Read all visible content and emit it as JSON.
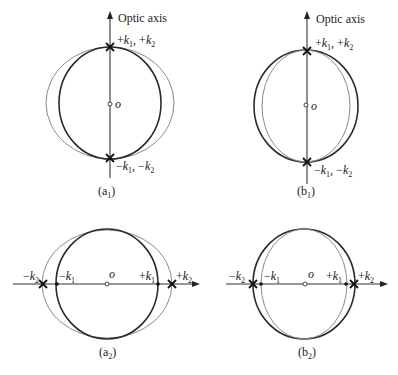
{
  "figure": {
    "panels": [
      {
        "id": "a1",
        "caption": "(a",
        "caption_sub": "1",
        "axis_label": "Optic axis",
        "origin_label": "o",
        "top_label": "+k1, +k2",
        "bottom_label": "−k1, −k2"
      },
      {
        "id": "b1",
        "caption": "(b",
        "caption_sub": "1",
        "axis_label": "Optic axis",
        "origin_label": "o",
        "top_label": "+k1, +k2",
        "bottom_label": "−k1, −k2"
      },
      {
        "id": "a2",
        "caption": "(a",
        "caption_sub": "2",
        "origin_label": "o",
        "labels": [
          "−k2",
          "−k1",
          "+k1",
          "+k2"
        ]
      },
      {
        "id": "b2",
        "caption": "(b",
        "caption_sub": "2",
        "origin_label": "o",
        "labels": [
          "−k2",
          "−k1",
          "+k1",
          "+k2"
        ]
      }
    ],
    "colors": {
      "dark_curve": "#2a2a2a",
      "light_curve": "#8a8a8a"
    }
  }
}
